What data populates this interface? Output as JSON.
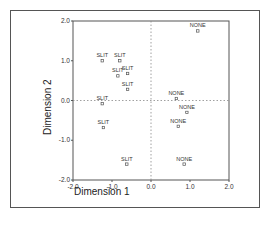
{
  "chart_data": {
    "type": "scatter",
    "title": "",
    "xlabel": "Dimension 1",
    "ylabel": "Dimension 2",
    "xlim": [
      -2.0,
      2.0
    ],
    "ylim": [
      -2.0,
      2.0
    ],
    "x_ticks": [
      "-2.0",
      "-1.0",
      "0.0",
      "1.0",
      "2.0"
    ],
    "y_ticks": [
      "2.0",
      "1.0",
      "0.0",
      "-1.0",
      "-2.0"
    ],
    "grid": false,
    "reference_lines": {
      "x": 0.0,
      "y": 0.0,
      "style": "dotted"
    },
    "legend": null,
    "points": [
      {
        "label": "NONE",
        "x": 1.2,
        "y": 1.75
      },
      {
        "label": "SLIT",
        "x": -1.25,
        "y": 1.0
      },
      {
        "label": "SLIT",
        "x": -0.8,
        "y": 1.0
      },
      {
        "label": "SLIT",
        "x": -0.85,
        "y": 0.62
      },
      {
        "label": "SLIT",
        "x": -0.6,
        "y": 0.68
      },
      {
        "label": "SLIT",
        "x": -0.6,
        "y": 0.28
      },
      {
        "label": "SLIT",
        "x": -1.25,
        "y": -0.08
      },
      {
        "label": "NONE",
        "x": 0.65,
        "y": 0.05
      },
      {
        "label": "NONE",
        "x": 0.92,
        "y": -0.3
      },
      {
        "label": "NONE",
        "x": 0.7,
        "y": -0.65
      },
      {
        "label": "SLIT",
        "x": -1.22,
        "y": -0.68
      },
      {
        "label": "SLIT",
        "x": -0.62,
        "y": -1.6
      },
      {
        "label": "NONE",
        "x": 0.85,
        "y": -1.6
      }
    ]
  },
  "axes": {
    "x_title": "Dimension 1",
    "y_title": "Dimension 2"
  },
  "colors": {
    "axis": "#555555",
    "text": "#333333",
    "reference": "#888888"
  }
}
